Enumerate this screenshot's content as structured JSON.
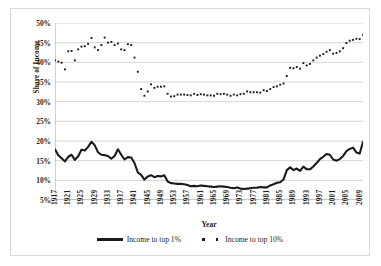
{
  "chart_data": {
    "type": "line",
    "title": "",
    "xlabel": "Year",
    "ylabel": "Share of Income",
    "xlim": [
      1917,
      2010
    ],
    "ylim": [
      5,
      50
    ],
    "ytick_step": 5,
    "ytick_labels": [
      "5%",
      "10%",
      "15%",
      "20%",
      "25%",
      "30%",
      "35%",
      "40%",
      "45%",
      "50%"
    ],
    "ytick_values": [
      5,
      10,
      15,
      20,
      25,
      30,
      35,
      40,
      45,
      50
    ],
    "xtick_labels": [
      "1917",
      "1921",
      "1925",
      "1929",
      "1933",
      "1937",
      "1941",
      "1945",
      "1949",
      "1953",
      "1957",
      "1961",
      "1965",
      "1969",
      "1973",
      "1977",
      "1981",
      "1985",
      "1989",
      "1993",
      "1997",
      "2001",
      "2005",
      "2009"
    ],
    "xtick_values": [
      1917,
      1921,
      1925,
      1929,
      1933,
      1937,
      1941,
      1945,
      1949,
      1953,
      1957,
      1961,
      1965,
      1969,
      1973,
      1977,
      1981,
      1985,
      1989,
      1993,
      1997,
      2001,
      2005,
      2009
    ],
    "xtick_interval": 4,
    "minor_xtick_interval": 1,
    "grid": "horizontal",
    "legend_position": "bottom-center",
    "x": [
      1917,
      1918,
      1919,
      1920,
      1921,
      1922,
      1923,
      1924,
      1925,
      1926,
      1927,
      1928,
      1929,
      1930,
      1931,
      1932,
      1933,
      1934,
      1935,
      1936,
      1937,
      1938,
      1939,
      1940,
      1941,
      1942,
      1943,
      1944,
      1945,
      1946,
      1947,
      1948,
      1949,
      1950,
      1951,
      1952,
      1953,
      1954,
      1955,
      1956,
      1957,
      1958,
      1959,
      1960,
      1961,
      1962,
      1963,
      1964,
      1965,
      1966,
      1967,
      1968,
      1969,
      1970,
      1971,
      1972,
      1973,
      1974,
      1975,
      1976,
      1977,
      1978,
      1979,
      1980,
      1981,
      1982,
      1983,
      1984,
      1985,
      1986,
      1987,
      1988,
      1989,
      1990,
      1991,
      1992,
      1993,
      1994,
      1995,
      1996,
      1997,
      1998,
      1999,
      2000,
      2001,
      2002,
      2003,
      2004,
      2005,
      2006,
      2007,
      2008,
      2009,
      2010
    ],
    "series": [
      {
        "name": "Income to top 1%",
        "style": "line",
        "color": "#1a1a1a",
        "values": [
          17.9,
          16.4,
          15.6,
          14.8,
          16.0,
          16.5,
          15.2,
          16.1,
          17.8,
          17.6,
          18.5,
          19.8,
          18.9,
          17.1,
          16.5,
          16.4,
          16.2,
          15.5,
          16.2,
          17.9,
          16.5,
          15.3,
          15.9,
          15.8,
          14.4,
          12.0,
          11.4,
          10.2,
          11.0,
          11.3,
          10.8,
          11.1,
          11.0,
          11.3,
          9.7,
          9.3,
          9.2,
          9.1,
          9.1,
          9.0,
          8.8,
          8.5,
          8.6,
          8.5,
          8.7,
          8.6,
          8.5,
          8.4,
          8.3,
          8.4,
          8.5,
          8.4,
          8.3,
          8.1,
          8.0,
          8.2,
          7.9,
          7.8,
          7.9,
          8.0,
          8.1,
          8.1,
          8.3,
          8.2,
          8.2,
          8.7,
          9.0,
          9.4,
          9.5,
          10.2,
          12.6,
          13.3,
          12.6,
          13.0,
          12.4,
          13.5,
          12.8,
          12.8,
          13.5,
          14.4,
          15.4,
          16.0,
          16.7,
          16.5,
          15.3,
          15.0,
          15.4,
          16.2,
          17.4,
          18.0,
          18.3,
          17.1,
          16.8,
          19.8
        ]
      },
      {
        "name": "Income to top 10%",
        "style": "scatter",
        "color": "#1a1a1a",
        "values": [
          40.5,
          40.2,
          39.9,
          38.2,
          42.8,
          42.9,
          40.5,
          43.3,
          44.0,
          44.1,
          44.7,
          46.2,
          43.8,
          43.1,
          44.4,
          46.3,
          45.0,
          45.2,
          44.4,
          44.8,
          43.3,
          43.1,
          44.6,
          44.4,
          41.2,
          37.6,
          33.2,
          31.5,
          32.6,
          34.4,
          33.5,
          33.8,
          33.8,
          33.9,
          32.0,
          31.3,
          31.4,
          31.8,
          31.8,
          31.8,
          31.7,
          31.6,
          32.0,
          31.7,
          31.9,
          31.8,
          31.6,
          31.6,
          31.5,
          32.0,
          31.9,
          32.0,
          31.8,
          31.5,
          31.8,
          31.6,
          31.9,
          32.0,
          32.6,
          32.4,
          32.4,
          32.4,
          32.3,
          32.9,
          32.7,
          33.2,
          33.7,
          33.9,
          34.3,
          34.6,
          36.5,
          38.6,
          38.5,
          38.8,
          38.4,
          39.8,
          39.2,
          39.6,
          40.5,
          41.2,
          41.7,
          42.1,
          42.7,
          43.1,
          42.2,
          42.4,
          42.8,
          43.6,
          44.9,
          45.5,
          45.7,
          46.0,
          45.9,
          47.0
        ]
      }
    ]
  },
  "legend": {
    "entries": [
      {
        "label": "Income to top 1%",
        "marker": "line-swatch"
      },
      {
        "label": "Income to top 10%",
        "marker": "dot-swatch"
      }
    ]
  },
  "axes": {
    "y_title": "Share of Income",
    "x_title": "Year"
  },
  "colors": {
    "series": "#1a1a1a",
    "gridline": "#c9c9c9",
    "axis": "#9a9a9a",
    "text": "#231f20",
    "border": "#d8d8d8",
    "background": "#ffffff"
  }
}
